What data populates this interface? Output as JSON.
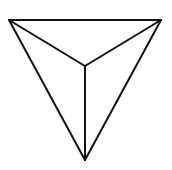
{
  "diagram": {
    "type": "line-drawing",
    "stroke_color": "#111111",
    "background_color": "#ffffff",
    "vertices": {
      "top_left": [
        9,
        20
      ],
      "top_right": [
        161,
        20
      ],
      "bottom": [
        85,
        160
      ],
      "apex": [
        85,
        66
      ]
    },
    "edges": [
      {
        "name": "top-edge",
        "from": "top_left",
        "to": "top_right"
      },
      {
        "name": "left-edge",
        "from": "top_left",
        "to": "bottom"
      },
      {
        "name": "right-edge",
        "from": "top_right",
        "to": "bottom"
      },
      {
        "name": "inner-edge-left",
        "from": "top_left",
        "to": "apex"
      },
      {
        "name": "inner-edge-right",
        "from": "top_right",
        "to": "apex"
      },
      {
        "name": "inner-edge-bottom",
        "from": "apex",
        "to": "bottom"
      }
    ]
  }
}
